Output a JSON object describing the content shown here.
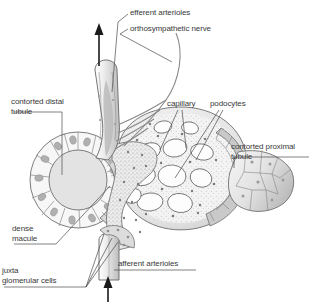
{
  "figure": {
    "background_color": "#ffffff",
    "width": 311,
    "height": 304
  },
  "labels": {
    "efferent_arterioles": "efferent arterioles",
    "orthosympathetic_nerve": "orthosympathetic nerve",
    "contorted_distal_tubule_line1": "contorted distal",
    "contorted_distal_tubule_line2": "tubule",
    "capillary": "capillary",
    "podocytes": "podocytes",
    "contorted_proximal_tubule_line1": "contorted proximal",
    "contorted_proximal_tubule_line2": "tubule",
    "dense_macule_line1": "dense",
    "dense_macule_line2": "macule",
    "juxta_glomerular_cells_line1": "juxta",
    "juxta_glomerular_cells_line2": "glomerular cells",
    "afferent_arterioles": "afferent arterioles"
  },
  "colors": {
    "text": "#3a3a3a",
    "leader_line": "#4a4a4a",
    "outline": "#6e6e6e",
    "outline_dark": "#505050",
    "cell_fill_light": "#f2f2f2",
    "cell_fill_mid": "#dcdcdc",
    "cell_fill_dark": "#c4c4c4",
    "nucleus": "#b5b5b5",
    "vessel_fill": "#e6e6e6",
    "glomerulus_fill": "#ededed",
    "arrow": "#1a1a1a"
  },
  "annotations": {
    "flow_in_arrow": "afferent blood flow in (upward arrow at bottom)",
    "flow_out_arrow": "efferent blood flow out (upward arrow at top)"
  }
}
